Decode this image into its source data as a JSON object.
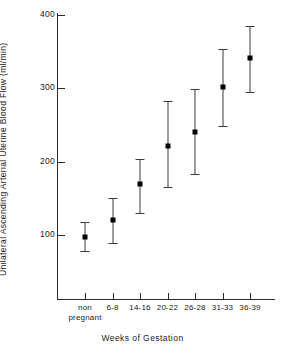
{
  "chart_data": {
    "type": "scatter",
    "title": "",
    "xlabel": "Weeks of Gestation",
    "ylabel": "Unilateral Ascending Arterial Uterine Blood Flow (ml/min)",
    "categories": [
      "non pregnant",
      "6-8",
      "14-16",
      "20-22",
      "26-28",
      "31-33",
      "36-39"
    ],
    "category_labels": [
      {
        "line1": "non",
        "line2": "pregnant"
      },
      {
        "line1": "6-8",
        "line2": ""
      },
      {
        "line1": "14-16",
        "line2": ""
      },
      {
        "line1": "20-22",
        "line2": ""
      },
      {
        "line1": "26-28",
        "line2": ""
      },
      {
        "line1": "31-33",
        "line2": ""
      },
      {
        "line1": "36-39",
        "line2": ""
      }
    ],
    "values": [
      97,
      120,
      169,
      222,
      240,
      302,
      342
    ],
    "err_low": [
      78,
      89,
      130,
      165,
      183,
      249,
      295
    ],
    "err_high": [
      118,
      151,
      203,
      283,
      299,
      353,
      385
    ],
    "ylim": [
      0,
      400
    ],
    "yticks": [
      100,
      200,
      300,
      400
    ],
    "ytick_labels": [
      "100",
      "200",
      "300",
      "400"
    ],
    "grid": false,
    "legend": "none",
    "marker": "filled-square",
    "error_bar_style": "capped-vertical"
  }
}
